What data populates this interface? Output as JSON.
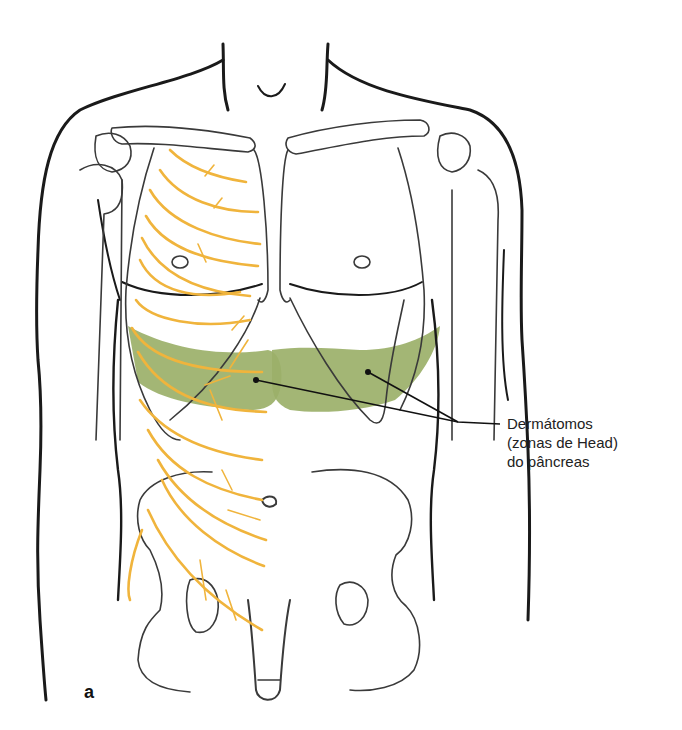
{
  "figure": {
    "panel_letter": "a",
    "colors": {
      "outline": "#1a1a1a",
      "bone": "#3a3a3a",
      "nerve": "#f0b43c",
      "dermatome_zone": "#9bb069",
      "background": "#ffffff"
    }
  },
  "annotation": {
    "lines": [
      "Dermátomos",
      "(zonas de Head)",
      "do pâncreas"
    ]
  }
}
